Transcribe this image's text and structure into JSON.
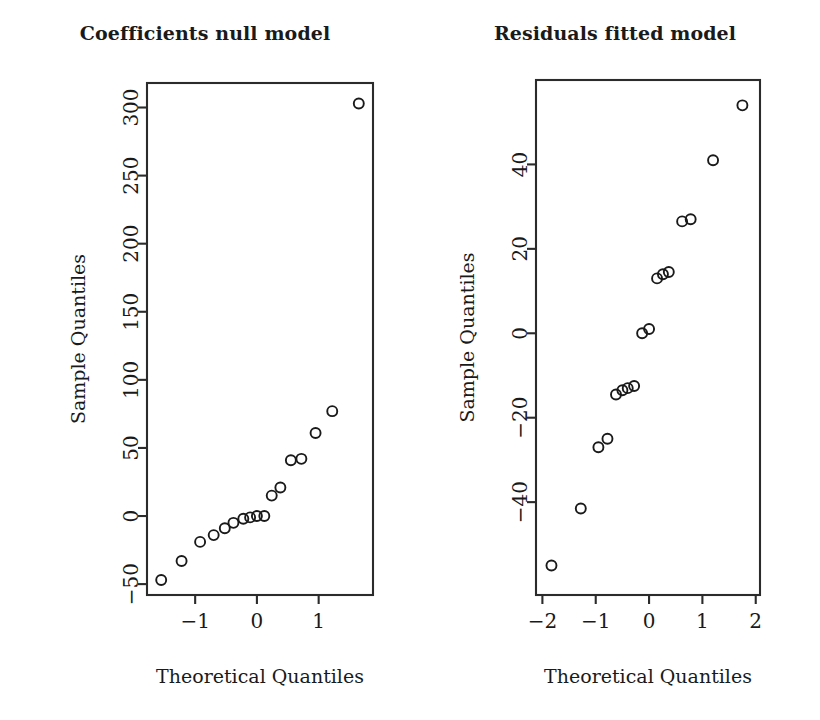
{
  "figure": {
    "background": "#ffffff",
    "foreground": "#1a1a1a",
    "panel_count": 2
  },
  "panels": [
    {
      "key": "coefficients_null_model",
      "title": "Coefficients null model",
      "xlabel": "Theoretical Quantiles",
      "ylabel": "Sample Quantiles"
    },
    {
      "key": "residuals_fitted_model",
      "title": "Residuals fitted model",
      "xlabel": "Theoretical Quantiles",
      "ylabel": "Sample Quantiles"
    }
  ],
  "chart_data": [
    {
      "type": "scatter",
      "title": "Coefficients null model",
      "xlabel": "Theoretical Quantiles",
      "ylabel": "Sample Quantiles",
      "xlim": [
        -1.78,
        1.88
      ],
      "ylim": [
        -58,
        318
      ],
      "xticks": [
        -1,
        0,
        1
      ],
      "xticklabels": [
        "−1",
        "0",
        "1"
      ],
      "yticks": [
        -50,
        0,
        50,
        100,
        150,
        200,
        250,
        300
      ],
      "yticklabels": [
        "−50",
        "0",
        "50",
        "100",
        "150",
        "200",
        "250",
        "300"
      ],
      "grid": false,
      "legend": false,
      "marker": "open-circle",
      "n_points": 17,
      "points": [
        {
          "x": -1.55,
          "y": -47
        },
        {
          "x": -1.22,
          "y": -33
        },
        {
          "x": -0.92,
          "y": -19
        },
        {
          "x": -0.7,
          "y": -14
        },
        {
          "x": -0.52,
          "y": -9
        },
        {
          "x": -0.38,
          "y": -5
        },
        {
          "x": -0.22,
          "y": -2
        },
        {
          "x": -0.11,
          "y": -1
        },
        {
          "x": 0.0,
          "y": 0
        },
        {
          "x": 0.12,
          "y": 0
        },
        {
          "x": 0.24,
          "y": 15
        },
        {
          "x": 0.38,
          "y": 21
        },
        {
          "x": 0.55,
          "y": 41
        },
        {
          "x": 0.72,
          "y": 42
        },
        {
          "x": 0.95,
          "y": 61
        },
        {
          "x": 1.22,
          "y": 77
        },
        {
          "x": 1.65,
          "y": 303
        }
      ]
    },
    {
      "type": "scatter",
      "title": "Residuals fitted model",
      "xlabel": "Theoretical Quantiles",
      "ylabel": "Sample Quantiles",
      "xlim": [
        -2.12,
        2.08
      ],
      "ylim": [
        -62,
        60
      ],
      "xticks": [
        -2,
        -1,
        0,
        1,
        2
      ],
      "xticklabels": [
        "−2",
        "−1",
        "0",
        "1",
        "2"
      ],
      "yticks": [
        -40,
        -20,
        0,
        20,
        40
      ],
      "yticklabels": [
        "−40",
        "−20",
        "0",
        "20",
        "40"
      ],
      "grid": false,
      "legend": false,
      "marker": "open-circle",
      "n_points": 16,
      "points": [
        {
          "x": -1.83,
          "y": -55
        },
        {
          "x": -1.28,
          "y": -41.5
        },
        {
          "x": -0.95,
          "y": -27
        },
        {
          "x": -0.78,
          "y": -25
        },
        {
          "x": -0.62,
          "y": -14.5
        },
        {
          "x": -0.5,
          "y": -13.5
        },
        {
          "x": -0.4,
          "y": -13
        },
        {
          "x": -0.28,
          "y": -12.5
        },
        {
          "x": -0.13,
          "y": 0
        },
        {
          "x": 0.0,
          "y": 1
        },
        {
          "x": 0.15,
          "y": 13
        },
        {
          "x": 0.26,
          "y": 14
        },
        {
          "x": 0.37,
          "y": 14.5
        },
        {
          "x": 0.62,
          "y": 26.5
        },
        {
          "x": 0.78,
          "y": 27
        },
        {
          "x": 1.2,
          "y": 41
        },
        {
          "x": 1.75,
          "y": 54
        }
      ]
    }
  ]
}
